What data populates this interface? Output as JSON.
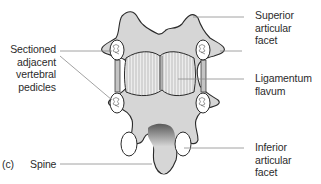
{
  "figure": {
    "panel_label": "(c)",
    "labels": {
      "superior_articular_facet": "Superior articular facet",
      "superior_line1": "Superior articular",
      "superior_line2": "facet",
      "sectioned_line1": "Sectioned",
      "sectioned_line2": "adjacent",
      "sectioned_line3": "vertebral",
      "sectioned_line4": "pedicles",
      "ligamentum_line1": "Ligamentum",
      "ligamentum_line2": "flavum",
      "inferior_line1": "Inferior articular",
      "inferior_line2": "facet",
      "spine": "Spine"
    },
    "colors": {
      "bone_fill": "#d6d6d6",
      "outline": "#2a2a2a",
      "leader_line": "#8a8a8a",
      "text": "#2b2b2b"
    },
    "structures": [
      "superior-articular-facet",
      "sectioned-pedicles",
      "ligamentum-flavum",
      "inferior-articular-facet",
      "spine"
    ]
  }
}
